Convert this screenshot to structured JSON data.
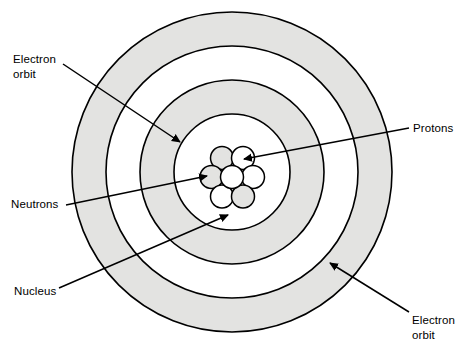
{
  "diagram": {
    "colors": {
      "stroke": "#000000",
      "shell_shade": "#e3e3e1",
      "shell_white": "#ffffff",
      "particle_light": "#ffffff",
      "particle_shade": "#e3e3e1",
      "background": "#ffffff",
      "text": "#000000"
    },
    "center": {
      "x": 232,
      "y": 172
    },
    "shells": [
      {
        "name": "outer-shell",
        "radius": 160,
        "fill": "shade"
      },
      {
        "name": "third-shell",
        "radius": 126,
        "fill": "white"
      },
      {
        "name": "second-shell",
        "radius": 92,
        "fill": "shade"
      },
      {
        "name": "nucleus-boundary",
        "radius": 58,
        "fill": "white"
      }
    ],
    "nucleus": {
      "particle_radius": 11.5,
      "particles": [
        {
          "id": "p-center",
          "cx": 232,
          "cy": 177,
          "fill": "light"
        },
        {
          "id": "p-upper-left",
          "cx": 222,
          "cy": 158,
          "fill": "shade"
        },
        {
          "id": "p-upper-right",
          "cx": 243,
          "cy": 158,
          "fill": "light"
        },
        {
          "id": "p-left",
          "cx": 211.5,
          "cy": 177,
          "fill": "shade"
        },
        {
          "id": "p-right",
          "cx": 253,
          "cy": 177,
          "fill": "light"
        },
        {
          "id": "p-lower-left",
          "cx": 222,
          "cy": 196.5,
          "fill": "light"
        },
        {
          "id": "p-lower-right",
          "cx": 243,
          "cy": 196.5,
          "fill": "shade"
        }
      ]
    },
    "pointers": [
      {
        "id": "pointer-electron-orbit-top",
        "x1": 63,
        "y1": 64,
        "x2": 180,
        "y2": 142
      },
      {
        "id": "pointer-protons",
        "x1": 409,
        "y1": 128,
        "x2": 238,
        "y2": 160
      },
      {
        "id": "pointer-neutrons",
        "x1": 66,
        "y1": 205,
        "x2": 208,
        "y2": 176
      },
      {
        "id": "pointer-nucleus",
        "x1": 59,
        "y1": 288,
        "x2": 228,
        "y2": 215
      },
      {
        "id": "pointer-electron-orbit-bottom",
        "x1": 409,
        "y1": 312,
        "x2": 330,
        "y2": 263
      }
    ]
  },
  "labels": {
    "electron_orbit_top": "Electron\norbit",
    "protons": "Protons",
    "neutrons": "Neutrons",
    "nucleus": "Nucleus",
    "electron_orbit_bottom": "Electron\norbit"
  }
}
